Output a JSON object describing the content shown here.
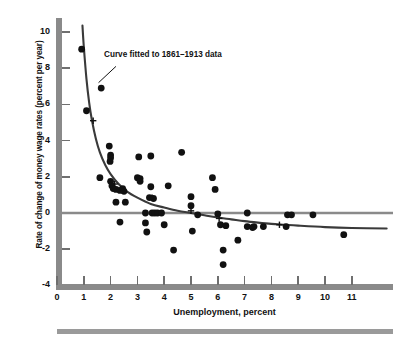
{
  "chart_data": {
    "type": "scatter",
    "title": "",
    "xlabel": "Unemployment, percent",
    "ylabel": "Rate of change of money wage rates (percent per year)",
    "xlim": [
      0,
      12.5
    ],
    "ylim": [
      -4,
      10.6
    ],
    "xticks": [
      0,
      1,
      2,
      3,
      4,
      5,
      6,
      7,
      8,
      9,
      10,
      11
    ],
    "xtick_labels": [
      "0",
      "1",
      "2",
      "3",
      "4",
      "5",
      "6",
      "7",
      "8",
      "9",
      "10",
      "11"
    ],
    "yticks": [
      -4,
      -2,
      0,
      2,
      4,
      6,
      8,
      10
    ],
    "ytick_labels": [
      "-4",
      "-2",
      "0",
      "2",
      "4",
      "6",
      "8",
      "10"
    ],
    "grid": false,
    "legend": null,
    "zero_line": {
      "y": 0,
      "color": "#8a8a8a",
      "label": "zero rate of change line"
    },
    "annotations": [
      {
        "text": "Curve fitted to 1861–1913 data",
        "x": 2.3,
        "y": 8.3,
        "leader_from": [
          2.2,
          8.1
        ],
        "leader_to": [
          1.55,
          7.2
        ]
      }
    ],
    "series": [
      {
        "name": "Observations",
        "type": "scatter",
        "marker": "filled-circle",
        "color": "#111111",
        "points": [
          [
            0.92,
            9.05
          ],
          [
            1.1,
            5.65
          ],
          [
            1.65,
            6.9
          ],
          [
            1.6,
            1.95
          ],
          [
            1.95,
            3.7
          ],
          [
            2.0,
            3.2
          ],
          [
            2.0,
            3.05
          ],
          [
            1.98,
            2.85
          ],
          [
            2.0,
            1.75
          ],
          [
            2.05,
            1.5
          ],
          [
            2.1,
            1.35
          ],
          [
            2.2,
            0.6
          ],
          [
            2.2,
            1.3
          ],
          [
            2.35,
            1.25
          ],
          [
            2.45,
            1.35
          ],
          [
            2.5,
            1.2
          ],
          [
            2.55,
            0.6
          ],
          [
            2.35,
            -0.5
          ],
          [
            3.05,
            3.1
          ],
          [
            3.5,
            3.15
          ],
          [
            3.0,
            1.95
          ],
          [
            3.1,
            1.9
          ],
          [
            3.1,
            1.75
          ],
          [
            3.5,
            1.45
          ],
          [
            3.45,
            0.85
          ],
          [
            3.6,
            0.8
          ],
          [
            3.3,
            -0.55
          ],
          [
            3.35,
            -1.05
          ],
          [
            3.3,
            0.0
          ],
          [
            3.55,
            0.0
          ],
          [
            3.65,
            0.0
          ],
          [
            3.75,
            0.0
          ],
          [
            3.9,
            0.0
          ],
          [
            4.0,
            -0.65
          ],
          [
            4.15,
            1.5
          ],
          [
            4.35,
            -2.05
          ],
          [
            4.65,
            3.35
          ],
          [
            5.0,
            0.9
          ],
          [
            5.0,
            0.4
          ],
          [
            5.05,
            -1.0
          ],
          [
            5.25,
            -0.1
          ],
          [
            5.8,
            1.95
          ],
          [
            5.9,
            1.3
          ],
          [
            6.0,
            -0.05
          ],
          [
            6.1,
            -0.65
          ],
          [
            6.3,
            -0.7
          ],
          [
            6.2,
            -2.05
          ],
          [
            6.2,
            -2.85
          ],
          [
            6.75,
            -1.5
          ],
          [
            7.1,
            0.0
          ],
          [
            7.1,
            -0.75
          ],
          [
            7.3,
            -0.8
          ],
          [
            7.35,
            -0.75
          ],
          [
            7.7,
            -0.75
          ],
          [
            8.55,
            -0.75
          ],
          [
            8.6,
            -0.1
          ],
          [
            8.75,
            -0.1
          ],
          [
            9.55,
            -0.1
          ],
          [
            10.7,
            -1.2
          ]
        ]
      },
      {
        "name": "Curve fitted to 1861-1913 data",
        "type": "line",
        "color": "#3a3a3a",
        "fitted_points": [
          [
            0.95,
            10.35
          ],
          [
            1.0,
            9.2
          ],
          [
            1.1,
            7.4
          ],
          [
            1.2,
            6.1
          ],
          [
            1.3,
            5.15
          ],
          [
            1.45,
            4.1
          ],
          [
            1.6,
            3.35
          ],
          [
            1.8,
            2.65
          ],
          [
            2.0,
            2.15
          ],
          [
            2.3,
            1.6
          ],
          [
            2.6,
            1.2
          ],
          [
            3.0,
            0.85
          ],
          [
            3.5,
            0.5
          ],
          [
            4.0,
            0.3
          ],
          [
            4.5,
            0.12
          ],
          [
            5.0,
            0.0
          ],
          [
            5.5,
            -0.12
          ],
          [
            6.0,
            -0.25
          ],
          [
            6.5,
            -0.35
          ],
          [
            7.0,
            -0.45
          ],
          [
            7.5,
            -0.53
          ],
          [
            8.0,
            -0.6
          ],
          [
            8.5,
            -0.65
          ],
          [
            9.0,
            -0.7
          ],
          [
            10.0,
            -0.78
          ],
          [
            11.0,
            -0.83
          ],
          [
            12.3,
            -0.86
          ]
        ]
      },
      {
        "name": "Fitted curve reference crosses",
        "type": "scatter",
        "marker": "plus-cross",
        "color": "#111111",
        "points": [
          [
            1.35,
            5.1
          ],
          [
            2.15,
            1.6
          ],
          [
            3.55,
            0.85
          ],
          [
            5.0,
            0.12
          ],
          [
            6.05,
            -0.3
          ],
          [
            8.3,
            -0.65
          ]
        ]
      }
    ]
  },
  "axes": {
    "y_axis_title": "Rate of change of money wage rates (percent per year)",
    "x_axis_title": "Unemployment, percent"
  },
  "colors": {
    "axis_bar": "#8a8a8a",
    "tick": "#6f6f6f",
    "curve": "#3a3a3a",
    "marker": "#111111",
    "zero_line": "#8a8a8a",
    "bottom_rule": "#9a9a9a",
    "background": "#ffffff"
  }
}
